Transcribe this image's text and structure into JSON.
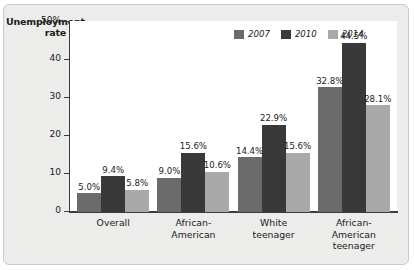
{
  "chart_data": {
    "type": "bar",
    "title": "",
    "xlabel": "",
    "ylabel": "Unemployment rate",
    "ylim": [
      0,
      50
    ],
    "grid": false,
    "legend_position": "top-right",
    "ytick_labels": [
      "50%",
      "40",
      "30",
      "20",
      "10",
      "0"
    ],
    "ytick_values": [
      50,
      40,
      30,
      20,
      10,
      0
    ],
    "categories": [
      "Overall",
      "African-American",
      "White teenager",
      "African-American teenager"
    ],
    "category_lines": [
      [
        "Overall"
      ],
      [
        "African-",
        "American"
      ],
      [
        "White",
        "teenager"
      ],
      [
        "African-",
        "American",
        "teenager"
      ]
    ],
    "series": [
      {
        "name": "2007",
        "color": "#6b6b6b",
        "values": [
          5.0,
          9.0,
          14.4,
          32.8
        ],
        "labels": [
          "5.0%",
          "9.0%",
          "14.4%",
          "32.8%"
        ]
      },
      {
        "name": "2010",
        "color": "#393939",
        "values": [
          9.4,
          15.6,
          22.9,
          44.5
        ],
        "labels": [
          "9.4%",
          "15.6%",
          "22.9%",
          "44.5%"
        ]
      },
      {
        "name": "2014",
        "color": "#a9a9a9",
        "values": [
          5.8,
          10.6,
          15.6,
          28.1
        ],
        "labels": [
          "5.8%",
          "10.6%",
          "15.6%",
          "28.1%"
        ]
      }
    ]
  },
  "axis_title": {
    "line1": "Unemployment",
    "line2": "rate"
  },
  "colors": {
    "page_background": "#ececeb",
    "plot_background": "#ffffff",
    "axis": "#3d3d3d",
    "text": "#1a1a1a"
  }
}
